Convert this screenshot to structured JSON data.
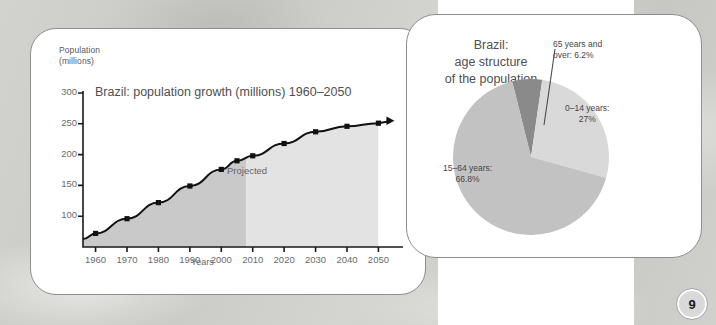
{
  "page": {
    "number": "9"
  },
  "left_card": {
    "chart_data": {
      "type": "line",
      "title": "Brazil: population growth (millions) 1960–2050",
      "ylabel": "Population\n(millions)",
      "ylabel_line1": "Population",
      "ylabel_line2": "(millions)",
      "xlabel": "Years",
      "ylim": [
        50,
        300
      ],
      "xlim": [
        1956,
        2054
      ],
      "yticks": [
        "100",
        "150",
        "200",
        "250",
        "300"
      ],
      "ytick_values": [
        100,
        150,
        200,
        250,
        300
      ],
      "xticks": [
        "1960",
        "1970",
        "1980",
        "1990",
        "2000",
        "2010",
        "2020",
        "2030",
        "2040",
        "2050"
      ],
      "xtick_values": [
        1960,
        1970,
        1980,
        1990,
        2000,
        2010,
        2020,
        2030,
        2040,
        2050
      ],
      "grid": false,
      "legend": "none",
      "x": [
        1956,
        1960,
        1970,
        1980,
        1990,
        2000,
        2005,
        2010,
        2020,
        2030,
        2040,
        2050
      ],
      "values": [
        63,
        72,
        96,
        122,
        149,
        176,
        190,
        198,
        218,
        237,
        246,
        251
      ],
      "area_fill": true,
      "annotations": [
        {
          "text": "Projected",
          "x": 2020,
          "note": "label inside lighter shaded band"
        }
      ],
      "shaded_regions": [
        {
          "name": "historical",
          "from": 1956,
          "to": 2008,
          "color": "#c9c9c9"
        },
        {
          "name": "projected",
          "from": 2008,
          "to": 2050,
          "color": "#e2e2e2"
        }
      ],
      "arrow_at_end": true,
      "line_color": "#111111",
      "marker": "square"
    }
  },
  "right_card": {
    "chart_data": {
      "type": "pie",
      "title_line1": "Brazil:",
      "title_line2": "age structure",
      "title_line3": "of the population",
      "title": "Brazil: age structure of the population",
      "categories": [
        "65 years and over",
        "0–14 years",
        "15–64 years"
      ],
      "values": [
        6.2,
        27.0,
        66.8
      ],
      "labels": [
        {
          "line1": "65 years and",
          "line2": "over: 6.2%",
          "color": "#8a8a8a"
        },
        {
          "line1": "0–14 years:",
          "line2": "27%",
          "color": "#d4d4d4"
        },
        {
          "line1": "15–64 years:",
          "line2": "66.8%",
          "color": "#c0c0c0"
        }
      ],
      "legend": "labels-on-slices",
      "units": "percent"
    }
  },
  "colors": {
    "slice_65plus": "#8a8a8a",
    "slice_0_14": "#d9d9d9",
    "slice_15_64": "#c2c2c2",
    "area_historical": "#c9c9c9",
    "area_projected": "#e2e2e2",
    "line": "#111111",
    "card_border": "#8e8e8e",
    "page_badge_bg": "#d9d9d9"
  }
}
